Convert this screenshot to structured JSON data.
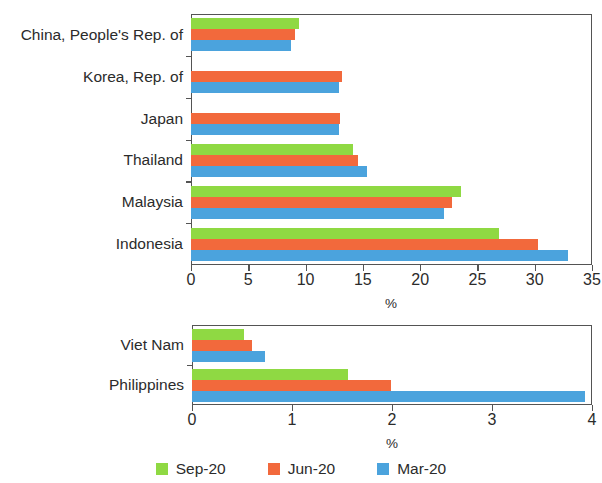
{
  "chart_data": [
    {
      "type": "bar",
      "orientation": "horizontal",
      "id": "upper",
      "title": "",
      "xlabel": "%",
      "ylabel": "",
      "xlim": [
        0,
        35
      ],
      "xticks": [
        0,
        5,
        10,
        15,
        20,
        25,
        30,
        35
      ],
      "xtick_labels": [
        "0",
        "5",
        "10",
        "15",
        "20",
        "25",
        "30",
        "35"
      ],
      "grid": false,
      "categories": [
        "China, People's Rep. of",
        "Korea, Rep. of",
        "Japan",
        "Thailand",
        "Malaysia",
        "Indonesia"
      ],
      "series": [
        {
          "name": "Sep-20",
          "color": "#8FD943",
          "values": [
            9.4,
            null,
            null,
            14.1,
            23.6,
            26.9
          ]
        },
        {
          "name": "Jun-20",
          "color": "#F2693C",
          "values": [
            9.1,
            13.2,
            13.0,
            14.6,
            22.8,
            30.3
          ]
        },
        {
          "name": "Mar-20",
          "color": "#4BA3DD",
          "values": [
            8.7,
            12.9,
            12.9,
            15.4,
            22.1,
            32.9
          ]
        }
      ]
    },
    {
      "type": "bar",
      "orientation": "horizontal",
      "id": "lower",
      "title": "",
      "xlabel": "%",
      "ylabel": "",
      "xlim": [
        0,
        4
      ],
      "xticks": [
        0,
        1,
        2,
        3,
        4
      ],
      "xtick_labels": [
        "0",
        "1",
        "2",
        "3",
        "4"
      ],
      "grid": false,
      "categories": [
        "Viet Nam",
        "Philippines"
      ],
      "series": [
        {
          "name": "Sep-20",
          "color": "#8FD943",
          "values": [
            0.52,
            1.56
          ]
        },
        {
          "name": "Jun-20",
          "color": "#F2693C",
          "values": [
            0.6,
            1.99
          ]
        },
        {
          "name": "Mar-20",
          "color": "#4BA3DD",
          "values": [
            0.73,
            3.93
          ]
        }
      ]
    }
  ],
  "legend": {
    "position": "bottom-center",
    "entries": [
      {
        "label": "Sep-20",
        "color": "#8FD943"
      },
      {
        "label": "Jun-20",
        "color": "#F2693C"
      },
      {
        "label": "Mar-20",
        "color": "#4BA3DD"
      }
    ]
  }
}
